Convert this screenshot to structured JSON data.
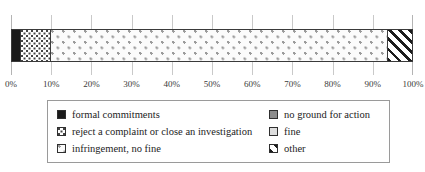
{
  "chart_data": {
    "type": "bar",
    "orientation": "horizontal",
    "stacked": true,
    "normalized_percent": true,
    "title": "",
    "subtitle": "",
    "xlabel": "",
    "ylabel": "",
    "xlim": [
      0,
      100
    ],
    "grid": true,
    "legend_position": "bottom",
    "categories": [
      ""
    ],
    "tick_labels": [
      "0%",
      "10%",
      "20%",
      "30%",
      "40%",
      "50%",
      "60%",
      "70%",
      "80%",
      "90%",
      "100%"
    ],
    "tick_values": [
      0,
      10,
      20,
      30,
      40,
      50,
      60,
      70,
      80,
      90,
      100
    ],
    "series": [
      {
        "name": "formal commitments",
        "values": [
          2.5
        ],
        "pattern": "solid-black",
        "color": "#1a1a1a"
      },
      {
        "name": "reject a complaint or close an investigation",
        "values": [
          7.5
        ],
        "pattern": "dense-dots",
        "color": "#444444"
      },
      {
        "name": "infringement, no fine",
        "values": [
          83.8
        ],
        "pattern": "sparse-dots",
        "color": "#9b9b9b"
      },
      {
        "name": "other",
        "values": [
          6.2
        ],
        "pattern": "diagonal-hatch",
        "color": "#1c1c1c"
      },
      {
        "name": "no ground for action",
        "values": [
          0
        ],
        "pattern": "solid-grey",
        "color": "#8c8c8c"
      },
      {
        "name": "fine",
        "values": [
          0
        ],
        "pattern": "light-grey",
        "color": "#dedede"
      }
    ]
  },
  "legend": {
    "items": [
      {
        "label": "formal commitments",
        "pattern": "solid-black"
      },
      {
        "label": "no ground for action",
        "pattern": "solid-grey"
      },
      {
        "label": "reject a complaint or close an investigation",
        "pattern": "dense-dots"
      },
      {
        "label": "fine",
        "pattern": "light-grey"
      },
      {
        "label": "infringement, no fine",
        "pattern": "sparse-dots"
      },
      {
        "label": "other",
        "pattern": "diagonal-hatch"
      }
    ]
  },
  "axis": {
    "ticks": [
      {
        "label": "0%",
        "value": 0
      },
      {
        "label": "10%",
        "value": 10
      },
      {
        "label": "20%",
        "value": 20
      },
      {
        "label": "30%",
        "value": 30
      },
      {
        "label": "40%",
        "value": 40
      },
      {
        "label": "50%",
        "value": 50
      },
      {
        "label": "60%",
        "value": 60
      },
      {
        "label": "70%",
        "value": 70
      },
      {
        "label": "80%",
        "value": 80
      },
      {
        "label": "90%",
        "value": 90
      },
      {
        "label": "100%",
        "value": 100
      }
    ]
  }
}
